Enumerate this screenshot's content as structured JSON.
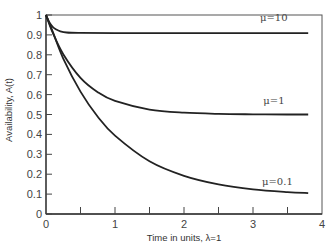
{
  "chart_data": {
    "type": "line",
    "title": "",
    "xlabel": "Time in units, λ=1",
    "ylabel": "Availability, A(t)",
    "xlim": [
      0,
      4
    ],
    "ylim": [
      0,
      1
    ],
    "grid": false,
    "x_ticks": [
      0,
      0.5,
      1,
      1.5,
      2,
      2.5,
      3,
      3.5,
      4
    ],
    "x_tick_labels": [
      "0",
      "",
      "1",
      "",
      "2",
      "",
      "3",
      "",
      "4"
    ],
    "y_ticks": [
      0,
      0.1,
      0.2,
      0.3,
      0.4,
      0.5,
      0.6,
      0.7,
      0.8,
      0.9,
      1
    ],
    "y_tick_labels": [
      "0",
      "0.1",
      "0.2",
      "0.3",
      "0.4",
      "0.5",
      "0.6",
      "0.7",
      "0.8",
      "0.9",
      "1"
    ],
    "series": [
      {
        "name": "μ=10",
        "label_pos": [
          3.1,
          0.97
        ],
        "x": [
          0,
          0.05,
          0.1,
          0.15,
          0.2,
          0.3,
          0.5,
          1,
          2,
          3,
          3.8
        ],
        "values": [
          1.0,
          0.962,
          0.939,
          0.927,
          0.919,
          0.912,
          0.91,
          0.909,
          0.909,
          0.909,
          0.909
        ]
      },
      {
        "name": "μ=1",
        "label_pos": [
          3.15,
          0.555
        ],
        "x": [
          0,
          0.1,
          0.25,
          0.5,
          0.75,
          1,
          1.5,
          2,
          2.5,
          3,
          3.5,
          3.8
        ],
        "values": [
          1.0,
          0.909,
          0.803,
          0.684,
          0.612,
          0.568,
          0.525,
          0.509,
          0.503,
          0.501,
          0.5,
          0.5
        ]
      },
      {
        "name": "μ=0.1",
        "label_pos": [
          3.13,
          0.147
        ],
        "x": [
          0,
          0.1,
          0.25,
          0.5,
          0.75,
          1,
          1.5,
          2,
          2.5,
          3,
          3.5,
          3.8
        ],
        "values": [
          1.0,
          0.914,
          0.781,
          0.615,
          0.489,
          0.394,
          0.265,
          0.192,
          0.149,
          0.124,
          0.11,
          0.105
        ]
      }
    ],
    "legend": "inline labels beside curves"
  }
}
